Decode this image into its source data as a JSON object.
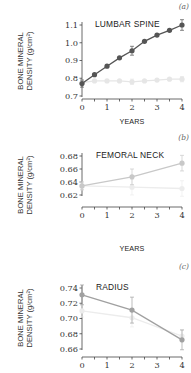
{
  "chart_data": [
    {
      "type": "line",
      "panel_letter": "(a)",
      "title": "LUMBAR SPINE",
      "xlabel": "YEARS",
      "ylabel_line1": "BONE MINERAL",
      "ylabel_line2": "DENSITY (g/cm²)",
      "ylim": [
        0.7,
        1.1
      ],
      "xlim": [
        0,
        4
      ],
      "yticks": [
        "0.7",
        "0.8",
        "0.9",
        "1.0",
        "1.1"
      ],
      "ytick_values": [
        0.7,
        0.8,
        0.9,
        1.0,
        1.1
      ],
      "xticks": [
        "0",
        "1",
        "2",
        "3",
        "4"
      ],
      "grid": false,
      "series": [
        {
          "name": "treated",
          "color": "#555555",
          "x": [
            0,
            0.5,
            1,
            1.5,
            2,
            2.5,
            3,
            3.5,
            4
          ],
          "values": [
            0.77,
            0.82,
            0.868,
            0.915,
            0.955,
            1.008,
            1.043,
            1.07,
            1.1
          ],
          "error": [
            0.02,
            0,
            0,
            0,
            0.025,
            0,
            0,
            0,
            0.03
          ]
        },
        {
          "name": "control",
          "color": "#e6e6e6",
          "x": [
            0,
            0.5,
            1,
            1.5,
            2,
            2.5,
            3,
            3.5,
            4
          ],
          "values": [
            0.775,
            0.785,
            0.785,
            0.785,
            0.78,
            0.785,
            0.79,
            0.795,
            0.795
          ],
          "error": [
            0,
            0,
            0,
            0,
            0.015,
            0,
            0,
            0,
            0.015
          ]
        }
      ]
    },
    {
      "type": "line",
      "panel_letter": "(b)",
      "title": "FEMORAL NECK",
      "xlabel": "YEARS",
      "ylabel_line1": "BONE MINERAL",
      "ylabel_line2": "DENSITY (g/cm²)",
      "ylim": [
        0.62,
        0.68
      ],
      "xlim": [
        0,
        4
      ],
      "yticks": [
        "0.62",
        "0.64",
        "0.66",
        "0.68"
      ],
      "ytick_values": [
        0.62,
        0.64,
        0.66,
        0.68
      ],
      "xticks": [
        "0",
        "1",
        "2",
        "3",
        "4"
      ],
      "grid": false,
      "series": [
        {
          "name": "treated",
          "color": "#c8c8c8",
          "x": [
            0,
            2,
            4
          ],
          "values": [
            0.634,
            0.648,
            0.669
          ],
          "error": [
            0.006,
            0.012,
            0.012
          ]
        },
        {
          "name": "control",
          "color": "#ececec",
          "x": [
            0,
            2,
            4
          ],
          "values": [
            0.634,
            0.632,
            0.63
          ],
          "error": [
            0.006,
            0.012,
            0.012
          ]
        }
      ]
    },
    {
      "type": "line",
      "panel_letter": "(c)",
      "title": "RADIUS",
      "xlabel": "",
      "ylabel_line1": "BONE MINERAL",
      "ylabel_line2": "DENSITY (g/cm²)",
      "ylim": [
        0.66,
        0.74
      ],
      "xlim": [
        0,
        4
      ],
      "yticks": [
        "0.66",
        "0.68",
        "0.70",
        "0.72",
        "0.74"
      ],
      "ytick_values": [
        0.66,
        0.68,
        0.7,
        0.72,
        0.74
      ],
      "xticks": [
        "0",
        "1",
        "2",
        "3",
        "4"
      ],
      "grid": false,
      "series": [
        {
          "name": "treated",
          "color": "#a0a0a0",
          "x": [
            0,
            2,
            4
          ],
          "values": [
            0.731,
            0.711,
            0.672
          ],
          "error": [
            0.013,
            0.017,
            0.013
          ]
        },
        {
          "name": "control",
          "color": "#ececec",
          "x": [
            0,
            2,
            4
          ],
          "values": [
            0.71,
            0.701,
            0.677
          ],
          "error": [
            0.008,
            0.012,
            0.008
          ]
        }
      ]
    }
  ]
}
